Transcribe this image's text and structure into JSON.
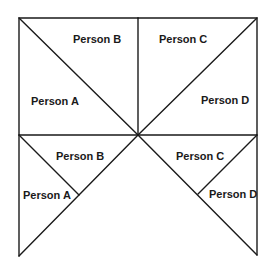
{
  "diagram": {
    "top_left": {
      "label_upper": "Person B",
      "label_lower": "Person A"
    },
    "top_right": {
      "label_upper": "Person C",
      "label_lower": "Person D"
    },
    "bottom_left": {
      "label_upper": "Person B",
      "label_lower": "Person A"
    },
    "bottom_right": {
      "label_upper": "Person C",
      "label_lower": "Person D"
    }
  }
}
